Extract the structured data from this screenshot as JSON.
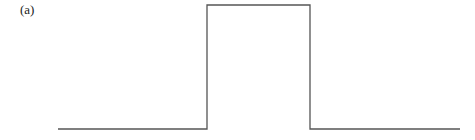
{
  "panel": {
    "label": "(a)"
  },
  "pulse": {
    "points": [
      [
        58,
        129
      ],
      [
        207,
        129
      ],
      [
        207,
        5
      ],
      [
        310,
        5
      ],
      [
        310,
        129
      ],
      [
        460,
        129
      ]
    ],
    "stroke": "#555555",
    "stroke_width": 1.3
  }
}
